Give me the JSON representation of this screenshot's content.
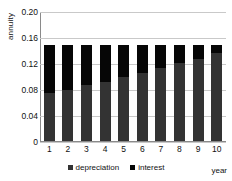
{
  "chart_data": {
    "type": "bar",
    "subtype": "stacked-bar",
    "title": "",
    "xlabel": "year",
    "ylabel": "annuity",
    "categories": [
      "1",
      "2",
      "3",
      "4",
      "5",
      "6",
      "7",
      "8",
      "9",
      "10"
    ],
    "x": [
      1,
      2,
      3,
      4,
      5,
      6,
      7,
      8,
      9,
      10
    ],
    "series": [
      {
        "name": "depreciation",
        "color": "#333333",
        "values": [
          0.075,
          0.08,
          0.087,
          0.093,
          0.1,
          0.106,
          0.114,
          0.121,
          0.128,
          0.137
        ]
      },
      {
        "name": "interest",
        "color": "#060606",
        "values": [
          0.075,
          0.07,
          0.063,
          0.057,
          0.05,
          0.044,
          0.036,
          0.029,
          0.022,
          0.013
        ]
      }
    ],
    "totals": [
      0.15,
      0.15,
      0.15,
      0.15,
      0.15,
      0.15,
      0.15,
      0.15,
      0.15,
      0.15
    ],
    "ylim": [
      0,
      0.2
    ],
    "yticks": [
      0,
      0.04,
      0.08,
      0.12,
      0.16,
      0.2
    ],
    "ytick_labels": [
      "0",
      "0.04",
      "0.08",
      "0.12",
      "0.16",
      "0.20"
    ],
    "grid": true,
    "grid_axis": "y",
    "legend": [
      "depreciation",
      "interest"
    ],
    "legend_position": "bottom"
  },
  "axes": {
    "y_title": "annuity",
    "x_title": "year"
  },
  "legend": {
    "items": [
      {
        "label": "depreciation",
        "color": "#333333"
      },
      {
        "label": "interest",
        "color": "#060606"
      }
    ]
  }
}
